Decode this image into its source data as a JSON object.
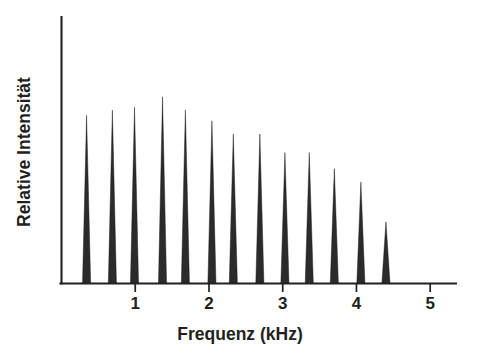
{
  "chart_data": {
    "type": "bar",
    "title": "",
    "subtitle": "",
    "xlabel": "Frequenz (kHz)",
    "ylabel": "Relative Intensität",
    "xlim": [
      0,
      5.35
    ],
    "ylim": [
      0,
      1.0
    ],
    "xticks": [
      1,
      2,
      3,
      4,
      5
    ],
    "xticklabels": [
      "1",
      "2",
      "3",
      "4",
      "5"
    ],
    "yticks": [],
    "yticklabels": [],
    "grid": false,
    "legend": null,
    "annotations": [],
    "series_name": "Spektrallinien",
    "peak_width_khz": 0.055,
    "line_color": "#231f20",
    "x": [
      0.34,
      0.69,
      0.99,
      1.37,
      1.68,
      2.04,
      2.33,
      2.69,
      3.03,
      3.36,
      3.7,
      4.06,
      4.4
    ],
    "values": [
      0.63,
      0.65,
      0.66,
      0.7,
      0.65,
      0.61,
      0.56,
      0.56,
      0.49,
      0.49,
      0.43,
      0.38,
      0.23
    ],
    "xtick_labels_note": "",
    "categories": [
      "0.34",
      "0.69",
      "0.99",
      "1.37",
      "1.68",
      "2.04",
      "2.33",
      "2.69",
      "3.03",
      "3.36",
      "3.70",
      "4.06",
      "4.40"
    ]
  },
  "figure": {
    "caption": ""
  }
}
